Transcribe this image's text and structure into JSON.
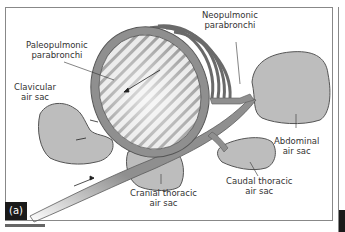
{
  "figure": {
    "panel_label": "(a)",
    "colors": {
      "tissue": "#8f8f8f",
      "tissue_dark": "#5a5a5a",
      "air_sac_fill": "#bdbdbd",
      "outline": "#555555",
      "background": "#ffffff"
    },
    "labels": {
      "paleopulmonic": "Paleopulmonic\nparabronchi",
      "paleopulmonic_l1": "Paleopulmonic",
      "paleopulmonic_l2": "parabronchi",
      "neopulmonic_l1": "Neopulmonic",
      "neopulmonic_l2": "parabronchi",
      "clavicular_l1": "Clavicular",
      "clavicular_l2": "air sac",
      "abdominal_l1": "Abdominal",
      "abdominal_l2": "air sac",
      "cranial_l1": "Cranial thoracic",
      "cranial_l2": "air sac",
      "caudal_l1": "Caudal thoracic",
      "caudal_l2": "air sac"
    }
  }
}
